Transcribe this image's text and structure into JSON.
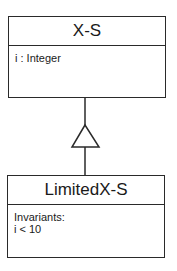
{
  "diagram": {
    "type": "uml-class-diagram",
    "relationship": "generalization",
    "superclass": {
      "name": "X-S",
      "attributes": [
        "i : Integer"
      ]
    },
    "subclass": {
      "name": "LimitedX-S",
      "constraints_label": "Invariants:",
      "constraints": [
        "i < 10"
      ]
    }
  }
}
